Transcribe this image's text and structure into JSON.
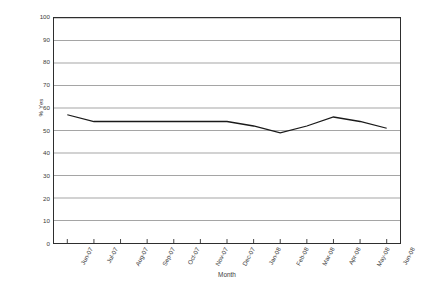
{
  "chart_data": {
    "type": "line",
    "title": "",
    "subtitle": "",
    "xlabel": "Month",
    "ylabel": "% Yes",
    "categories": [
      "Jun-07",
      "Jul-07",
      "Aug-07",
      "Sep-07",
      "Oct-07",
      "Nov-07",
      "Dec-07",
      "Jan-08",
      "Feb-08",
      "Mar-08",
      "Apr-08",
      "May-08",
      "Jun-08"
    ],
    "values": [
      57,
      54,
      54,
      54,
      54,
      54,
      54,
      52,
      49,
      52,
      56,
      54,
      51
    ],
    "series": [
      {
        "name": "% Yes",
        "values": [
          57,
          54,
          54,
          54,
          54,
          54,
          54,
          52,
          49,
          52,
          56,
          54,
          51
        ],
        "color": "#1a1a1a"
      }
    ],
    "ylim": [
      0,
      100
    ],
    "ytick_values": [
      0,
      10,
      20,
      30,
      40,
      50,
      60,
      70,
      80,
      90,
      100
    ],
    "ytick_labels": [
      "0",
      "10",
      "20",
      "30",
      "40",
      "50",
      "60",
      "70",
      "80",
      "90",
      "100"
    ],
    "grid": "horizontal",
    "grid_color": "#9a9a9a",
    "legend": "none",
    "legend_position": "none",
    "line_color": "#1a1a1a",
    "markers": "none",
    "plot_border_color": "#2e2e2e",
    "background_color": "#ffffff",
    "xtick_rotation": -62
  },
  "figure": {
    "caption": ""
  }
}
